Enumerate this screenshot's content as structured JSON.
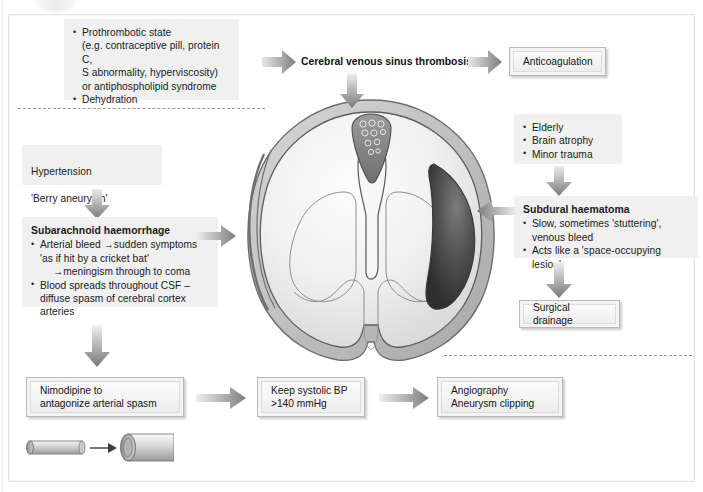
{
  "figure": {
    "accent_color": "#8a8a8a",
    "box_fill": "#f0f0f0",
    "treatment_fill": "#f4f4f4"
  },
  "causes": {
    "venous_sinus": {
      "items": [
        "Prothrombotic state",
        "(e.g. contraceptive pill, protein C,",
        "S abnormality, hyperviscosity)",
        "or antiphospholipid syndrome",
        "Dehydration"
      ],
      "bullet_1_line_1": "Prothrombotic state",
      "bullet_1_line_2": "(e.g. contraceptive pill, protein C,",
      "bullet_1_line_3": "S abnormality, hyperviscosity)",
      "bullet_1_line_4": "or antiphospholipid syndrome",
      "bullet_2": "Dehydration"
    },
    "subarachnoid": {
      "line_1": "Hypertension",
      "line_2": "'Berry aneurysm'"
    },
    "subdural": {
      "bullets": [
        "Elderly",
        "Brain atrophy",
        "Minor trauma"
      ]
    }
  },
  "conditions": {
    "venous_sinus_thrombosis": {
      "label": "Cerebral venous sinus thrombosis"
    },
    "subarachnoid_haemorrhage": {
      "heading": "Subarachnoid haemorrhage",
      "bullet_1_line_1": "Arterial bleed →sudden symptoms",
      "bullet_1_line_2": "'as if hit by a cricket bat'",
      "bullet_1_line_3": "→meningism through to coma",
      "bullet_2_line_1": "Blood spreads throughout CSF –",
      "bullet_2_line_2": "diffuse spasm of cerebral cortex",
      "bullet_2_line_3": "arteries"
    },
    "subdural_haematoma": {
      "heading": "Subdural haematoma",
      "bullet_1_line_1": "Slow, sometimes 'stuttering',",
      "bullet_1_line_2": "venous bleed",
      "bullet_2_line_1": "Acts like a 'space-occupying lesion'"
    }
  },
  "treatments": {
    "anticoagulation": "Anticoagulation",
    "surgical_drainage": "Surgical drainage",
    "nimodipine": "Nimodipine to\nantagonize arterial spasm",
    "keep_bp": "Keep systolic BP\n>140 mmHg",
    "angiography": "Angiography\nAneurysm clipping"
  },
  "anatomy": {
    "brain_label": "coronal-brain-section",
    "sagittal_sinus": "superior-sagittal-sinus",
    "haematoma": "subdural-haematoma-collection",
    "ventricles": "lateral-ventricles",
    "subarachnoid_blood": "subarachnoid-blood-stripe"
  },
  "vessel_diagram": {
    "left": "constricted-vessel-in-spasm",
    "right": "dilated-vessel-after-nimodipine",
    "arrow": "to"
  }
}
